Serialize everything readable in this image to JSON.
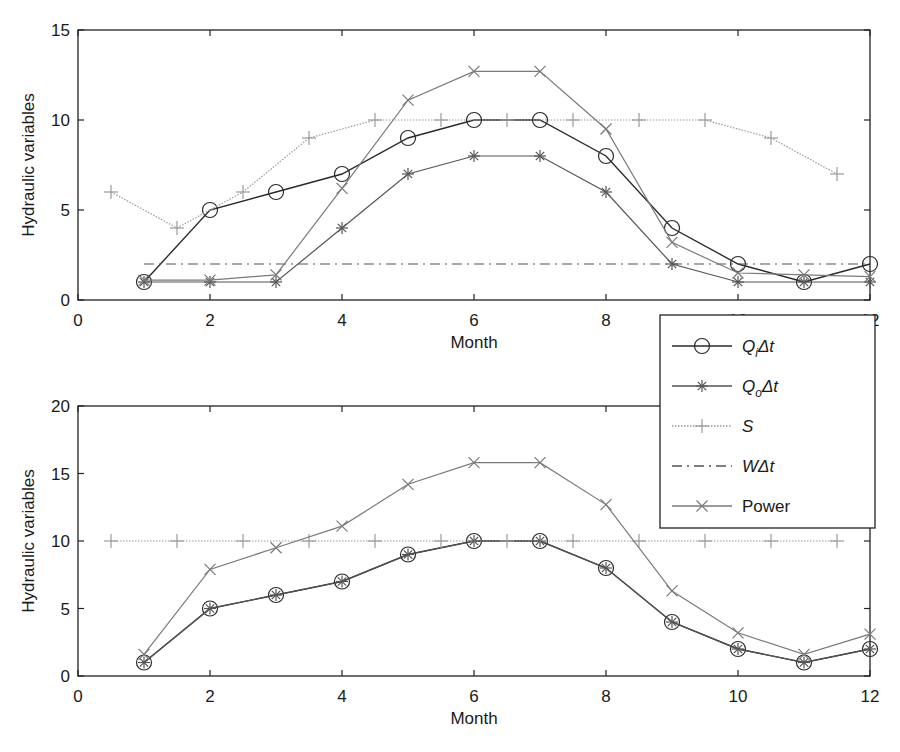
{
  "figure": {
    "width": 900,
    "height": 752
  },
  "chart_data": [
    {
      "type": "line",
      "title": "",
      "xlabel": "Month",
      "ylabel": "Hydraulic variables",
      "xlim": [
        0,
        12
      ],
      "ylim": [
        0,
        15
      ],
      "xticks": [
        0,
        2,
        4,
        6,
        8,
        10,
        12
      ],
      "yticks": [
        0,
        5,
        10,
        15
      ],
      "grid": false,
      "legend_position": "outside-right-between-panels",
      "series": [
        {
          "name": "Q_i Δt",
          "marker": "o",
          "style": "solid",
          "color": "#2a2a2a",
          "x": [
            1,
            2,
            3,
            4,
            5,
            6,
            7,
            8,
            9,
            10,
            11,
            12
          ],
          "y": [
            1,
            5,
            6,
            7,
            9,
            10,
            10,
            8,
            4,
            2,
            1,
            2
          ]
        },
        {
          "name": "Q_o Δt",
          "marker": "*",
          "style": "solid",
          "color": "#555555",
          "x": [
            1,
            2,
            3,
            4,
            5,
            6,
            7,
            8,
            9,
            10,
            11,
            12
          ],
          "y": [
            1,
            1,
            1,
            4,
            7,
            8,
            8,
            6,
            2,
            1,
            1,
            1
          ]
        },
        {
          "name": "S",
          "marker": "+",
          "style": "dotted",
          "color": "#9a9a9a",
          "x": [
            0.5,
            1.5,
            2.5,
            3.5,
            4.5,
            5.5,
            6.5,
            7.5,
            8.5,
            9.5,
            10.5,
            11.5
          ],
          "y": [
            6,
            4,
            6,
            9,
            10,
            10,
            10,
            10,
            10,
            10,
            9,
            7
          ]
        },
        {
          "name": "W Δt",
          "marker": "none",
          "style": "dashdot",
          "color": "#555555",
          "x": [
            1,
            12
          ],
          "y": [
            2,
            2
          ]
        },
        {
          "name": "Power",
          "marker": "x",
          "style": "solid",
          "color": "#7a7a7a",
          "x": [
            1,
            2,
            3,
            4,
            5,
            6,
            7,
            8,
            9,
            10,
            11,
            12
          ],
          "y": [
            1.1,
            1.1,
            1.4,
            6.2,
            11.1,
            12.7,
            12.7,
            9.5,
            3.2,
            1.5,
            1.4,
            1.3
          ]
        }
      ]
    },
    {
      "type": "line",
      "title": "",
      "xlabel": "Month",
      "ylabel": "Hydraulic variables",
      "xlim": [
        0,
        12
      ],
      "ylim": [
        0,
        20
      ],
      "xticks": [
        0,
        2,
        4,
        6,
        8,
        10,
        12
      ],
      "yticks": [
        0,
        5,
        10,
        15,
        20
      ],
      "grid": false,
      "series": [
        {
          "name": "Q_i Δt",
          "marker": "o",
          "style": "solid",
          "color": "#2a2a2a",
          "x": [
            1,
            2,
            3,
            4,
            5,
            6,
            7,
            8,
            9,
            10,
            11,
            12
          ],
          "y": [
            1,
            5,
            6,
            7,
            9,
            10,
            10,
            8,
            4,
            2,
            1,
            2
          ]
        },
        {
          "name": "Q_o Δt",
          "marker": "*",
          "style": "solid",
          "color": "#555555",
          "x": [
            1,
            2,
            3,
            4,
            5,
            6,
            7,
            8,
            9,
            10,
            11,
            12
          ],
          "y": [
            1,
            5,
            6,
            7,
            9,
            10,
            10,
            8,
            4,
            2,
            1,
            2
          ]
        },
        {
          "name": "S",
          "marker": "+",
          "style": "dotted",
          "color": "#9a9a9a",
          "x": [
            0.5,
            1.5,
            2.5,
            3.5,
            4.5,
            5.5,
            6.5,
            7.5,
            8.5,
            9.5,
            10.5,
            11.5
          ],
          "y": [
            10,
            10,
            10,
            10,
            10,
            10,
            10,
            10,
            10,
            10,
            10,
            10
          ]
        },
        {
          "name": "Power",
          "marker": "x",
          "style": "solid",
          "color": "#7a7a7a",
          "x": [
            1,
            2,
            3,
            4,
            5,
            6,
            7,
            8,
            9,
            10,
            11,
            12
          ],
          "y": [
            1.6,
            7.9,
            9.5,
            11.1,
            14.2,
            15.8,
            15.8,
            12.7,
            6.3,
            3.2,
            1.6,
            3.1
          ]
        }
      ]
    }
  ],
  "legend": {
    "items": [
      {
        "label_main": "Q",
        "label_sub": "i",
        "label_tail": "Δt",
        "italic": true,
        "marker": "o",
        "style": "solid",
        "color": "#2a2a2a"
      },
      {
        "label_main": "Q",
        "label_sub": "o",
        "label_tail": "Δt",
        "italic": true,
        "marker": "*",
        "style": "solid",
        "color": "#555555"
      },
      {
        "label_main": "S",
        "label_sub": "",
        "label_tail": "",
        "italic": true,
        "marker": "+",
        "style": "dotted",
        "color": "#9a9a9a"
      },
      {
        "label_main": "W",
        "label_sub": "",
        "label_tail": "Δt",
        "italic": true,
        "marker": "none",
        "style": "dashdot",
        "color": "#555555"
      },
      {
        "label_main": "Power",
        "label_sub": "",
        "label_tail": "",
        "italic": false,
        "marker": "x",
        "style": "solid",
        "color": "#7a7a7a"
      }
    ]
  }
}
